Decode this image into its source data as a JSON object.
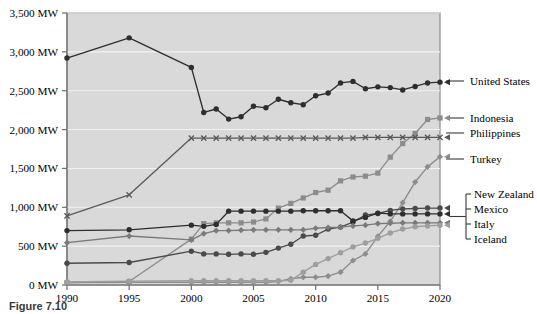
{
  "figure": {
    "caption": "Figure 7.10"
  },
  "chart_data": {
    "type": "line",
    "title": "",
    "xlabel": "",
    "ylabel": "",
    "xlim": [
      1990,
      2020
    ],
    "ylim": [
      0,
      3500
    ],
    "grid": true,
    "grid_orientation": "horizontal",
    "legend_position": "right-outside-with-leader-lines",
    "plot_background": "#d9d9d9",
    "ytick_labels": [
      "0 MW",
      "500 MW",
      "1,000 MW",
      "1,500 MW",
      "2,000 MW",
      "2,500 MW",
      "3,000 MW",
      "3,500 MW"
    ],
    "ytick_values": [
      0,
      500,
      1000,
      1500,
      2000,
      2500,
      3000,
      3500
    ],
    "xtick_labels": [
      "1990",
      "1995",
      "2000",
      "2005",
      "2010",
      "2015",
      "2020"
    ],
    "xtick_values": [
      1990,
      1995,
      2000,
      2005,
      2010,
      2015,
      2020
    ],
    "x": [
      1990,
      1995,
      2000,
      2001,
      2002,
      2003,
      2004,
      2005,
      2006,
      2007,
      2008,
      2009,
      2010,
      2011,
      2012,
      2013,
      2014,
      2015,
      2016,
      2017,
      2018,
      2019,
      2020
    ],
    "series": [
      {
        "name": "United States",
        "color": "#2e2e2e",
        "marker": "circle",
        "values": [
          2920,
          3180,
          2800,
          2220,
          2265,
          2135,
          2165,
          2300,
          2280,
          2390,
          2345,
          2320,
          2435,
          2470,
          2600,
          2620,
          2525,
          2550,
          2540,
          2510,
          2555,
          2600,
          2610
        ]
      },
      {
        "name": "Indonesia",
        "color": "#8c8c8c",
        "marker": "square",
        "values": [
          30,
          45,
          590,
          790,
          800,
          800,
          800,
          810,
          850,
          990,
          1050,
          1120,
          1190,
          1220,
          1340,
          1390,
          1400,
          1440,
          1645,
          1820,
          1950,
          2130,
          2150
        ]
      },
      {
        "name": "Philippines",
        "color": "#5a5a5a",
        "marker": "x",
        "values": [
          890,
          1160,
          1890,
          1890,
          1890,
          1890,
          1890,
          1890,
          1890,
          1890,
          1890,
          1890,
          1890,
          1890,
          1890,
          1890,
          1900,
          1900,
          1900,
          1900,
          1900,
          1900,
          1900
        ]
      },
      {
        "name": "Turkey",
        "color": "#8c8c8c",
        "marker": "diamond",
        "values": [
          30,
          35,
          35,
          35,
          35,
          35,
          35,
          35,
          35,
          45,
          80,
          100,
          100,
          115,
          165,
          315,
          400,
          625,
          820,
          1060,
          1325,
          1520,
          1650
        ]
      },
      {
        "name": "New Zealand",
        "color": "#4a4a4a",
        "marker": "circle",
        "values": [
          280,
          290,
          435,
          400,
          400,
          395,
          400,
          395,
          420,
          475,
          525,
          630,
          640,
          720,
          745,
          810,
          900,
          920,
          960,
          980,
          985,
          990,
          990
        ]
      },
      {
        "name": "Mexico",
        "color": "#2e2e2e",
        "marker": "circle",
        "values": [
          700,
          710,
          770,
          755,
          780,
          950,
          950,
          950,
          950,
          950,
          950,
          955,
          955,
          955,
          955,
          825,
          870,
          925,
          915,
          915,
          915,
          915,
          915
        ]
      },
      {
        "name": "Italy",
        "color": "#7a7a7a",
        "marker": "diamond",
        "values": [
          545,
          630,
          580,
          660,
          700,
          700,
          705,
          710,
          710,
          710,
          710,
          710,
          730,
          740,
          745,
          760,
          770,
          790,
          795,
          800,
          800,
          800,
          800
        ]
      },
      {
        "name": "Iceland",
        "color": "#9e9e9e",
        "marker": "circle",
        "values": [
          40,
          50,
          55,
          55,
          55,
          55,
          55,
          55,
          55,
          55,
          60,
          165,
          265,
          340,
          415,
          490,
          540,
          600,
          670,
          720,
          750,
          760,
          770
        ]
      }
    ],
    "legend_entries": [
      {
        "label": "United States",
        "value_at_end": 2610,
        "style": "arrow"
      },
      {
        "label": "Indonesia",
        "value_at_end": 2150,
        "style": "arrow"
      },
      {
        "label": "Philippines",
        "value_at_end": 1900,
        "style": "arrow"
      },
      {
        "label": "Turkey",
        "value_at_end": 1650,
        "style": "arrow"
      },
      {
        "label": "New Zealand",
        "value_at_end": 990,
        "style": "bracket"
      },
      {
        "label": "Mexico",
        "value_at_end": 915,
        "style": "bracket"
      },
      {
        "label": "Italy",
        "value_at_end": 800,
        "style": "bracket"
      },
      {
        "label": "Iceland",
        "value_at_end": 770,
        "style": "bracket"
      }
    ]
  }
}
